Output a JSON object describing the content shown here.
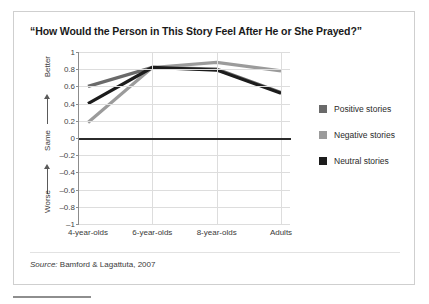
{
  "figure": {
    "title": "“How Would the Person in This Story Feel After He or She Prayed?”",
    "source_prefix": "Source:",
    "source_text": "Bamford & Lagattuta, 2007"
  },
  "axis": {
    "y_descriptors": [
      {
        "label": "Better",
        "icon": "up-arrow-icon"
      },
      {
        "label": "Same",
        "icon": "up-arrow-icon"
      },
      {
        "label": "Worse",
        "icon": "none"
      }
    ],
    "y_ticks": [
      "1",
      "0.8",
      "0.6",
      "0.4",
      "0.2",
      "0",
      "–0.2",
      "–0.4",
      "–0.6",
      "–0.8",
      "–1"
    ],
    "x_ticks": [
      "4-year-olds",
      "6-year-olds",
      "8-year-olds",
      "Adults"
    ]
  },
  "legend": {
    "position": "right",
    "items": [
      {
        "label": "Positive stories",
        "color": "#6a6a6a"
      },
      {
        "label": "Negative stories",
        "color": "#9b9b9b"
      },
      {
        "label": "Neutral stories",
        "color": "#1c1c1c"
      }
    ]
  },
  "chart_data": {
    "type": "line",
    "title": "“How Would the Person in This Story Feel After He or She Prayed?”",
    "xlabel": "",
    "ylabel": "",
    "categories": [
      "4-year-olds",
      "6-year-olds",
      "8-year-olds",
      "Adults"
    ],
    "series": [
      {
        "name": "Positive stories",
        "color": "#6a6a6a",
        "values": [
          0.6,
          0.82,
          0.8,
          0.53
        ]
      },
      {
        "name": "Negative stories",
        "color": "#9b9b9b",
        "values": [
          0.18,
          0.82,
          0.88,
          0.78
        ]
      },
      {
        "name": "Neutral stories",
        "color": "#1c1c1c",
        "values": [
          0.4,
          0.82,
          0.79,
          0.52
        ]
      }
    ],
    "ylim": [
      -1,
      1
    ],
    "ytick_values": [
      1,
      0.8,
      0.6,
      0.4,
      0.2,
      0,
      -0.2,
      -0.4,
      -0.6,
      -0.8,
      -1
    ],
    "ytick_labels": [
      "1",
      "0.8",
      "0.6",
      "0.4",
      "0.2",
      "0",
      "–0.2",
      "–0.4",
      "–0.6",
      "–0.8",
      "–1"
    ],
    "y_scale_anchors": [
      "Better",
      "Same",
      "Worse"
    ],
    "grid": true,
    "zero_line": true,
    "legend_position": "right",
    "source": "Bamford & Lagattuta, 2007"
  }
}
